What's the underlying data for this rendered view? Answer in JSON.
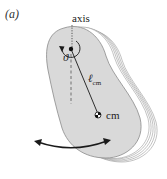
{
  "figure": {
    "panel_label": "(a)",
    "labels": {
      "axis": "axis",
      "angle": "ϑ",
      "length_main": "ℓ",
      "length_sub": "cm",
      "cm": "cm"
    },
    "colors": {
      "body_fill": "#d9d9d9",
      "body_stroke": "#8a8a8a",
      "layer_stroke": "#9a9a9a",
      "ink": "#1a1a1a"
    }
  }
}
